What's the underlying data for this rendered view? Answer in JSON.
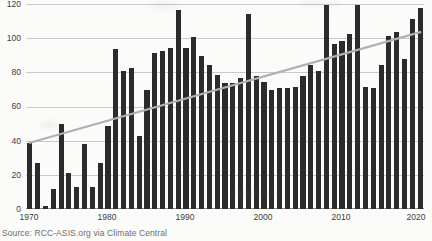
{
  "source": {
    "text": "Source: RCC-ASIS.org via Climate Central"
  },
  "chart_data": {
    "type": "bar",
    "title": "",
    "subtitle": "",
    "xlabel": "",
    "ylabel": "",
    "ylim": [
      0,
      120
    ],
    "yticks": [
      0,
      20,
      40,
      60,
      80,
      100,
      120
    ],
    "xticks": [
      1970,
      1980,
      1990,
      2000,
      2010,
      2020
    ],
    "grid": true,
    "legend": "none",
    "bar_color": "#2b2b2b",
    "trendline_color": "#b0b0b0",
    "categories": [
      1970,
      1971,
      1972,
      1973,
      1974,
      1975,
      1976,
      1977,
      1978,
      1979,
      1980,
      1981,
      1982,
      1983,
      1984,
      1985,
      1986,
      1987,
      1988,
      1989,
      1990,
      1991,
      1992,
      1993,
      1994,
      1995,
      1996,
      1997,
      1998,
      1999,
      2000,
      2001,
      2002,
      2003,
      2004,
      2005,
      2006,
      2007,
      2008,
      2009,
      2010,
      2011,
      2012,
      2013,
      2014,
      2015,
      2016,
      2017,
      2018,
      2019,
      2020
    ],
    "values": [
      39,
      27,
      2,
      12,
      50,
      21,
      13,
      38,
      13,
      27,
      49,
      94,
      81,
      83,
      43,
      70,
      92,
      93,
      95,
      117,
      95,
      101,
      90,
      85,
      79,
      74,
      74,
      77,
      115,
      78,
      75,
      70,
      71,
      71,
      72,
      78,
      85,
      81,
      120,
      97,
      99,
      103,
      120,
      72,
      71,
      85,
      102,
      104,
      88,
      112,
      118
    ],
    "trendline": {
      "type": "linear",
      "x_start": 1970,
      "y_start": 39,
      "x_end": 2020,
      "y_end": 104
    }
  }
}
